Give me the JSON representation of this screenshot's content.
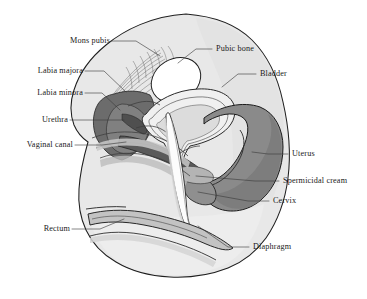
{
  "figure": {
    "background_color": "#ffffff",
    "outline_color": "#1a1a1a",
    "label_text_color": "#1a1a1a",
    "leader_line_color": "#3a3a3a"
  },
  "palette": {
    "page_background": "#ffffff",
    "body_tissue_light": "#e3e3e3",
    "body_tissue_lighter": "#ececec",
    "body_tissue_pale": "#f1f1f1",
    "pubic_bone_fill": "#ffffff",
    "bladder_fill": "#efefef",
    "uterus_fill": "#8c8c8c",
    "uterus_dark": "#7a7a7a",
    "vaginal_wedge_fill": "#6f6f6f",
    "rectum_fill": "#c5c5c5",
    "diaphragm_fill": "#fbfbfb",
    "spermicidal_cream_fill": "#b0b0b0",
    "shadow_gray": "#a9a9a9",
    "mid_gray": "#9a9a9a"
  },
  "labels": [
    {
      "id": "mons-pubis",
      "text": "Mons pubis",
      "side": "left",
      "text_x": 71,
      "text_y": 43,
      "leader": [
        [
          126,
          43
        ],
        [
          150,
          43
        ],
        [
          172,
          57
        ]
      ]
    },
    {
      "id": "labia-majora",
      "text": "Labia majora",
      "side": "left",
      "text_x": 29,
      "text_y": 73,
      "leader": [
        [
          92,
          73
        ],
        [
          108,
          73
        ],
        [
          126,
          86
        ]
      ]
    },
    {
      "id": "labia-minora",
      "text": "Labia minora",
      "side": "left",
      "text_x": 29,
      "text_y": 95,
      "leader": [
        [
          92,
          95
        ],
        [
          104,
          95
        ],
        [
          120,
          104
        ]
      ]
    },
    {
      "id": "urethra",
      "text": "Urethra",
      "side": "left",
      "text_x": 40,
      "text_y": 122,
      "leader": [
        [
          79,
          122
        ],
        [
          100,
          122
        ],
        [
          116,
          118
        ]
      ]
    },
    {
      "id": "vaginal-canal",
      "text": "Vaginal canal",
      "side": "left",
      "text_x": 16,
      "text_y": 147,
      "leader": [
        [
          81,
          147
        ],
        [
          104,
          147
        ],
        [
          122,
          141
        ]
      ]
    },
    {
      "id": "rectum",
      "text": "Rectum",
      "side": "left",
      "text_x": 38,
      "text_y": 231,
      "leader": [
        [
          79,
          231
        ],
        [
          104,
          231
        ],
        [
          124,
          222
        ]
      ]
    },
    {
      "id": "pubic-bone",
      "text": "Pubic bone",
      "side": "right",
      "text_x": 215,
      "text_y": 51,
      "leader": [
        [
          212,
          51
        ],
        [
          196,
          51
        ],
        [
          178,
          63
        ]
      ]
    },
    {
      "id": "bladder",
      "text": "Bladder",
      "side": "right",
      "text_x": 258,
      "text_y": 76,
      "leader": [
        [
          255,
          76
        ],
        [
          240,
          76
        ],
        [
          225,
          86
        ]
      ]
    },
    {
      "id": "uterus",
      "text": "Uterus",
      "side": "right",
      "text_x": 290,
      "text_y": 156,
      "leader": [
        [
          287,
          156
        ],
        [
          268,
          156
        ],
        [
          250,
          152
        ]
      ]
    },
    {
      "id": "spermicidal-cream",
      "text": "Spermicidal cream",
      "side": "right",
      "text_x": 281,
      "text_y": 183,
      "leader": [
        [
          278,
          183
        ],
        [
          258,
          183
        ],
        [
          178,
          175
        ]
      ]
    },
    {
      "id": "cervix",
      "text": "Cervix",
      "side": "right",
      "text_x": 271,
      "text_y": 203,
      "leader": [
        [
          268,
          203
        ],
        [
          250,
          203
        ],
        [
          190,
          193
        ]
      ]
    },
    {
      "id": "diaphragm",
      "text": "Diaphragm",
      "side": "right",
      "text_x": 251,
      "text_y": 249,
      "leader": [
        [
          248,
          249
        ],
        [
          228,
          249
        ],
        [
          196,
          224
        ]
      ]
    }
  ],
  "structures": [
    {
      "id": "body-outline",
      "name": "Body tissue silhouette"
    },
    {
      "id": "mons-pubis-hatching",
      "name": "Mons pubis hair hatching"
    },
    {
      "id": "pubic-bone",
      "name": "Pubic bone"
    },
    {
      "id": "bladder",
      "name": "Bladder"
    },
    {
      "id": "uterus",
      "name": "Uterus"
    },
    {
      "id": "cervix",
      "name": "Cervix"
    },
    {
      "id": "vaginal-canal",
      "name": "Vaginal canal"
    },
    {
      "id": "labia-majora",
      "name": "Labia majora"
    },
    {
      "id": "labia-minora",
      "name": "Labia minora"
    },
    {
      "id": "urethra",
      "name": "Urethra"
    },
    {
      "id": "rectum",
      "name": "Rectum"
    },
    {
      "id": "diaphragm",
      "name": "Contraceptive diaphragm"
    },
    {
      "id": "spermicidal-cream",
      "name": "Spermicidal cream"
    }
  ]
}
